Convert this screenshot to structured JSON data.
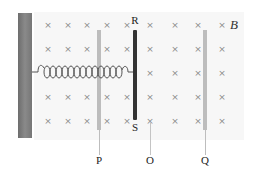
{
  "diagram": {
    "field_label": "B",
    "field_symbol": "×",
    "field_rows_y": [
      25,
      49,
      73,
      97,
      121
    ],
    "field_cols_x": [
      48,
      68,
      87,
      107,
      127,
      150,
      175,
      198,
      222
    ],
    "rails": [
      {
        "id": "P",
        "label": "P",
        "x": 99
      },
      {
        "id": "O",
        "label": "O",
        "x": 150
      },
      {
        "id": "Q",
        "label": "Q",
        "x": 205
      }
    ],
    "rod": {
      "top_label": "R",
      "bottom_label": "S",
      "x": 135
    },
    "colors": {
      "wall": "#7a7a7a",
      "rod": "#333333",
      "rail": "#bdbdbd",
      "spring": "#555555",
      "field_bg": "#f7f7f7"
    }
  }
}
